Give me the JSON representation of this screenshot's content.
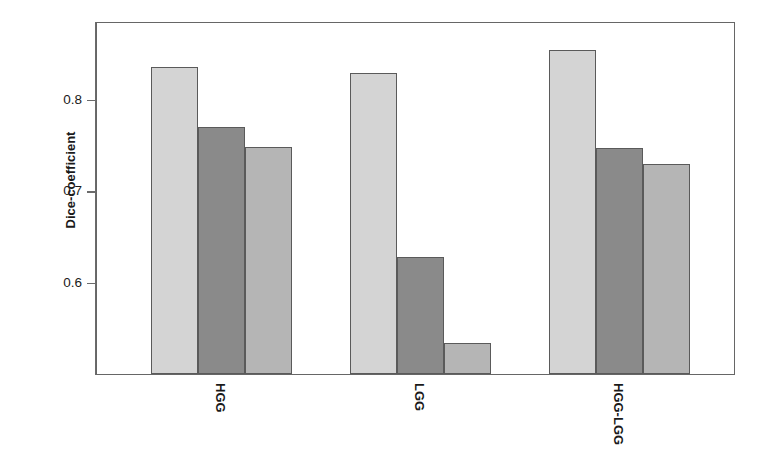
{
  "chart_data": {
    "type": "bar",
    "title": "",
    "subtitle": "",
    "xlabel": "",
    "ylabel": "Dice-coefficient",
    "categories": [
      "HGG",
      "LGG",
      "HGG-LGG"
    ],
    "series": [
      {
        "name": "series-1",
        "color": "#d4d4d4",
        "values": [
          0.836,
          0.829,
          0.854
        ]
      },
      {
        "name": "series-2",
        "color": "#8a8a8a",
        "values": [
          0.77,
          0.628,
          0.747
        ]
      },
      {
        "name": "series-3",
        "color": "#b5b5b5",
        "values": [
          0.748,
          0.534,
          0.73
        ]
      }
    ],
    "ylim": [
      0.5,
      0.886
    ],
    "yticks": [
      0.6,
      0.7,
      0.8
    ],
    "ytick_labels": [
      "0.6",
      "0.7",
      "0.8"
    ],
    "grid": false,
    "legend": "none",
    "frame": true,
    "bar_edge_color": "#5a5a5a",
    "axis_color": "#6b6b6b",
    "background": "#ffffff"
  }
}
